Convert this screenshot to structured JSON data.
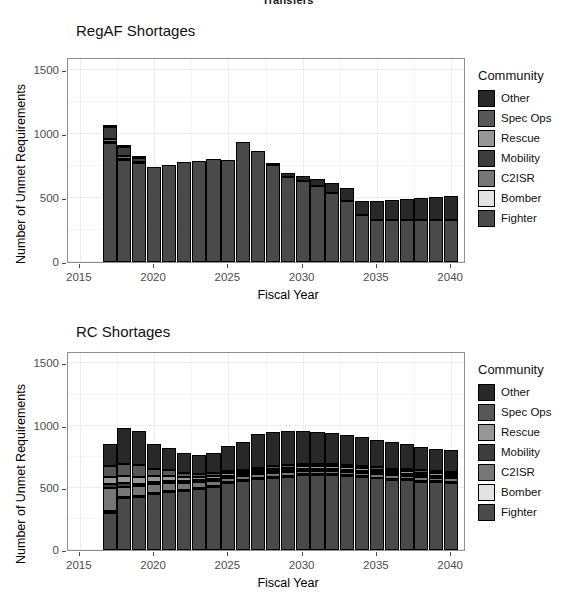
{
  "page": {
    "cut_off_header": "Transfers"
  },
  "legend": {
    "title": "Community",
    "items": [
      {
        "label": "Other",
        "color": "#282828"
      },
      {
        "label": "Spec Ops",
        "color": "#575757"
      },
      {
        "label": "Rescue",
        "color": "#969696"
      },
      {
        "label": "Mobility",
        "color": "#3d3d3d"
      },
      {
        "label": "C2ISR",
        "color": "#767676"
      },
      {
        "label": "Bomber",
        "color": "#e3e3e3"
      },
      {
        "label": "Fighter",
        "color": "#4a4a4a"
      }
    ]
  },
  "chart_data": [
    {
      "type": "bar",
      "stacked": true,
      "title": "RegAF Shortages",
      "xlabel": "Fiscal Year",
      "ylabel": "Number of Unmet Requirements",
      "xlim": [
        2014.2,
        2041.0
      ],
      "ylim": [
        0,
        1600
      ],
      "yticks": [
        0,
        500,
        1000,
        1500
      ],
      "xticks": [
        2015,
        2020,
        2025,
        2030,
        2035,
        2040
      ],
      "grid": true,
      "legend_position": "right",
      "categories": [
        2017,
        2018,
        2019,
        2020,
        2021,
        2022,
        2023,
        2024,
        2025,
        2026,
        2027,
        2028,
        2029,
        2030,
        2031,
        2032,
        2033,
        2034,
        2035,
        2036,
        2037,
        2038,
        2039,
        2040
      ],
      "series": [
        {
          "name": "Fighter",
          "values": [
            930,
            800,
            770,
            740,
            755,
            780,
            785,
            805,
            800,
            940,
            865,
            755,
            665,
            630,
            590,
            540,
            475,
            370,
            330,
            330,
            330,
            330,
            330,
            330
          ]
        },
        {
          "name": "Bomber",
          "values": [
            8,
            6,
            4,
            0,
            0,
            0,
            0,
            0,
            0,
            0,
            0,
            0,
            0,
            0,
            0,
            0,
            0,
            0,
            0,
            0,
            0,
            0,
            0,
            0
          ]
        },
        {
          "name": "C2ISR",
          "values": [
            22,
            18,
            10,
            0,
            0,
            0,
            0,
            0,
            0,
            0,
            0,
            0,
            0,
            0,
            0,
            0,
            0,
            0,
            0,
            0,
            0,
            0,
            0,
            0
          ]
        },
        {
          "name": "Mobility",
          "values": [
            90,
            70,
            25,
            0,
            0,
            0,
            0,
            0,
            0,
            0,
            0,
            0,
            0,
            0,
            0,
            0,
            0,
            0,
            0,
            0,
            0,
            0,
            0,
            0
          ]
        },
        {
          "name": "Rescue",
          "values": [
            0,
            0,
            0,
            0,
            0,
            0,
            0,
            0,
            0,
            0,
            0,
            0,
            0,
            0,
            0,
            0,
            0,
            0,
            0,
            0,
            0,
            0,
            0,
            0
          ]
        },
        {
          "name": "Spec Ops",
          "values": [
            0,
            0,
            0,
            0,
            0,
            0,
            0,
            0,
            0,
            0,
            0,
            0,
            0,
            0,
            0,
            0,
            0,
            0,
            0,
            0,
            0,
            0,
            0,
            0
          ]
        },
        {
          "name": "Other",
          "values": [
            10,
            8,
            6,
            0,
            0,
            0,
            0,
            0,
            0,
            0,
            0,
            15,
            30,
            40,
            55,
            75,
            105,
            110,
            150,
            155,
            160,
            170,
            175,
            185
          ]
        }
      ],
      "totals": [
        1060,
        902,
        815,
        740,
        755,
        780,
        785,
        805,
        800,
        940,
        865,
        770,
        695,
        670,
        645,
        615,
        580,
        480,
        480,
        485,
        490,
        500,
        505,
        515
      ]
    },
    {
      "type": "bar",
      "stacked": true,
      "title": "RC Shortages",
      "xlabel": "Fiscal Year",
      "ylabel": "Number of Unmet Requirements",
      "xlim": [
        2014.2,
        2041.0
      ],
      "ylim": [
        0,
        1600
      ],
      "yticks": [
        0,
        500,
        1000,
        1500
      ],
      "xticks": [
        2015,
        2020,
        2025,
        2030,
        2035,
        2040
      ],
      "grid": true,
      "legend_position": "right",
      "categories": [
        2017,
        2018,
        2019,
        2020,
        2021,
        2022,
        2023,
        2024,
        2025,
        2026,
        2027,
        2028,
        2029,
        2030,
        2031,
        2032,
        2033,
        2034,
        2035,
        2036,
        2037,
        2038,
        2039,
        2040
      ],
      "series": [
        {
          "name": "Fighter",
          "values": [
            300,
            420,
            430,
            450,
            465,
            475,
            490,
            510,
            540,
            555,
            570,
            580,
            590,
            600,
            600,
            600,
            595,
            585,
            575,
            565,
            560,
            550,
            545,
            540
          ]
        },
        {
          "name": "Bomber",
          "values": [
            14,
            10,
            8,
            8,
            8,
            8,
            8,
            8,
            8,
            8,
            8,
            8,
            8,
            8,
            8,
            8,
            8,
            8,
            8,
            8,
            8,
            8,
            8,
            8
          ]
        },
        {
          "name": "C2ISR",
          "values": [
            185,
            80,
            75,
            70,
            65,
            55,
            45,
            40,
            35,
            30,
            30,
            30,
            28,
            28,
            28,
            28,
            28,
            28,
            28,
            28,
            28,
            28,
            28,
            28
          ]
        },
        {
          "name": "Mobility",
          "values": [
            30,
            25,
            20,
            20,
            18,
            18,
            16,
            16,
            16,
            16,
            16,
            16,
            16,
            16,
            16,
            16,
            16,
            16,
            16,
            16,
            16,
            16,
            16,
            16
          ]
        },
        {
          "name": "Rescue",
          "values": [
            55,
            60,
            58,
            45,
            40,
            32,
            25,
            22,
            20,
            20,
            20,
            20,
            20,
            20,
            20,
            20,
            20,
            20,
            20,
            20,
            20,
            20,
            20,
            20
          ]
        },
        {
          "name": "Spec Ops",
          "values": [
            90,
            100,
            95,
            60,
            45,
            35,
            28,
            22,
            18,
            18,
            18,
            18,
            18,
            18,
            18,
            18,
            18,
            18,
            18,
            18,
            18,
            18,
            18,
            18
          ]
        },
        {
          "name": "Other",
          "values": [
            176,
            290,
            274,
            197,
            179,
            157,
            148,
            162,
            203,
            223,
            268,
            278,
            280,
            270,
            260,
            250,
            240,
            230,
            220,
            210,
            200,
            190,
            180,
            175
          ]
        }
      ],
      "totals": [
        850,
        985,
        960,
        850,
        820,
        780,
        760,
        780,
        840,
        870,
        930,
        950,
        960,
        960,
        950,
        940,
        925,
        905,
        885,
        865,
        850,
        830,
        815,
        805
      ]
    }
  ]
}
